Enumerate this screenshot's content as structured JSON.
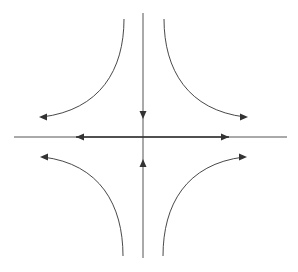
{
  "diagram": {
    "type": "phase-portrait",
    "colors": {
      "background": "#ffffff",
      "stroke": "#333333",
      "axis": "#555555"
    },
    "axes": {
      "horizontal": {
        "x1": 14,
        "x2": 287,
        "y": 137
      },
      "vertical": {
        "x": 143,
        "y1": 13,
        "y2": 258
      }
    },
    "axis_arrows": [
      {
        "name": "arrow-down-on-vertical",
        "tip": [
          143,
          119
        ],
        "direction": "down"
      },
      {
        "name": "arrow-up-on-vertical",
        "tip": [
          143,
          159
        ],
        "direction": "up"
      },
      {
        "name": "arrow-left-on-horizontal",
        "tip": [
          76,
          137
        ],
        "direction": "left"
      },
      {
        "name": "arrow-right-on-horizontal",
        "tip": [
          229,
          137
        ],
        "direction": "right"
      }
    ],
    "trajectories": [
      {
        "name": "upper-left-trajectory",
        "path": "M124 19 C124 70 100 110 42 117",
        "arrow_tip": [
          39,
          117
        ],
        "arrow_dir": "left"
      },
      {
        "name": "upper-right-trajectory",
        "path": "M164 19 C164 70 188 110 245 117",
        "arrow_tip": [
          248,
          117
        ],
        "arrow_dir": "right"
      },
      {
        "name": "lower-left-trajectory",
        "path": "M123 256 C123 205 100 164 43 157",
        "arrow_tip": [
          40,
          157
        ],
        "arrow_dir": "left"
      },
      {
        "name": "lower-right-trajectory",
        "path": "M163 256 C163 205 186 164 244 157",
        "arrow_tip": [
          247,
          157
        ],
        "arrow_dir": "right"
      }
    ]
  }
}
